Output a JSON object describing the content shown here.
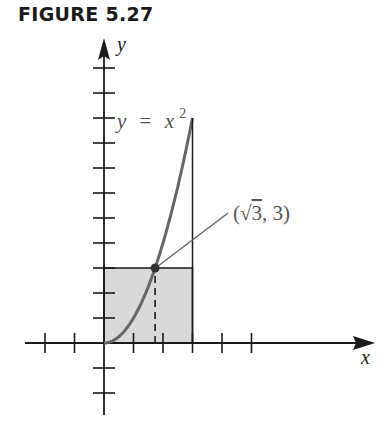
{
  "figure": {
    "label": "FIGURE 5.27"
  },
  "chart_data": {
    "type": "line",
    "title": "FIGURE 5.27",
    "xlabel": "x",
    "ylabel": "y",
    "curve": {
      "label": "y = x²",
      "label_parts": {
        "lhs": "y",
        "eq": "=",
        "base": "x",
        "exp": "2"
      },
      "function": "x^2",
      "domain": [
        0,
        3
      ],
      "points": [
        [
          0,
          0
        ],
        [
          0.5,
          0.25
        ],
        [
          1,
          1
        ],
        [
          1.5,
          2.25
        ],
        [
          1.732,
          3
        ],
        [
          2,
          4
        ],
        [
          2.5,
          6.25
        ],
        [
          3,
          9
        ]
      ]
    },
    "highlighted_point": {
      "label": "(√3, 3)",
      "label_parts": {
        "open": "(",
        "sqrt": "√",
        "radicand": "3",
        "sep": ", ",
        "y": "3",
        "close": ")"
      },
      "x": 1.732,
      "y": 3
    },
    "shaded_rectangle": {
      "x": [
        0,
        3
      ],
      "y": [
        0,
        3
      ],
      "color": "#d9d9d9"
    },
    "vertical_line": {
      "x": 3,
      "y": [
        0,
        9
      ]
    },
    "dashed_line": {
      "x": 1.732,
      "y": [
        0,
        3
      ]
    },
    "x_ticks": [
      -2,
      -1,
      1,
      2,
      3,
      4,
      5
    ],
    "y_ticks": [
      -2,
      -1,
      1,
      2,
      3,
      4,
      5,
      6,
      7,
      8,
      9,
      10,
      11
    ],
    "xlim": [
      -2.5,
      8.5
    ],
    "ylim": [
      -2.2,
      11.8
    ],
    "grid": false
  }
}
